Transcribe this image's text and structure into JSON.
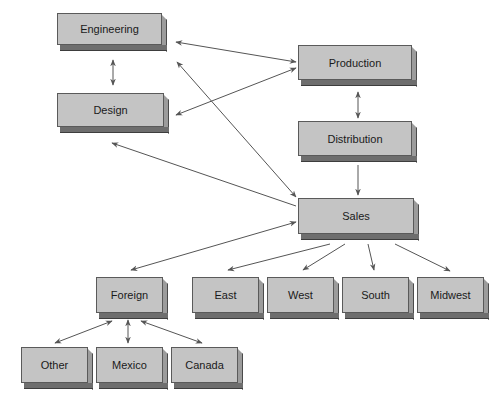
{
  "diagram": {
    "type": "organizational-flow",
    "colors": {
      "box_face": "#c4c4c4",
      "box_side": "#9c9c9c",
      "box_bottom": "#6e6e6e",
      "arrow": "#555555"
    },
    "nodes": {
      "engineering": {
        "label": "Engineering",
        "x": 57,
        "y": 13,
        "w": 110,
        "h": 38
      },
      "production": {
        "label": "Production",
        "x": 298,
        "y": 45,
        "w": 119,
        "h": 41
      },
      "design": {
        "label": "Design",
        "x": 57,
        "y": 93,
        "w": 112,
        "h": 40
      },
      "distribution": {
        "label": "Distribution",
        "x": 298,
        "y": 121,
        "w": 119,
        "h": 41
      },
      "sales": {
        "label": "Sales",
        "x": 298,
        "y": 198,
        "w": 121,
        "h": 42
      },
      "foreign": {
        "label": "Foreign",
        "x": 96,
        "y": 277,
        "w": 72,
        "h": 42
      },
      "east": {
        "label": "East",
        "x": 192,
        "y": 277,
        "w": 72,
        "h": 42
      },
      "west": {
        "label": "West",
        "x": 267,
        "y": 277,
        "w": 72,
        "h": 42
      },
      "south": {
        "label": "South",
        "x": 342,
        "y": 277,
        "w": 72,
        "h": 42
      },
      "midwest": {
        "label": "Midwest",
        "x": 417,
        "y": 277,
        "w": 72,
        "h": 42
      },
      "other": {
        "label": "Other",
        "x": 21,
        "y": 347,
        "w": 72,
        "h": 42
      },
      "mexico": {
        "label": "Mexico",
        "x": 96,
        "y": 347,
        "w": 72,
        "h": 42
      },
      "canada": {
        "label": "Canada",
        "x": 171,
        "y": 347,
        "w": 72,
        "h": 42
      }
    },
    "edges": [
      {
        "from": "engineering",
        "to": "design",
        "bidirectional": true,
        "x1": 113,
        "y1": 60,
        "x2": 113,
        "y2": 85
      },
      {
        "from": "engineering",
        "to": "production",
        "bidirectional": true,
        "x1": 176,
        "y1": 42,
        "x2": 296,
        "y2": 62
      },
      {
        "from": "design",
        "to": "production",
        "bidirectional": true,
        "x1": 176,
        "y1": 115,
        "x2": 296,
        "y2": 68
      },
      {
        "from": "engineering",
        "to": "sales",
        "bidirectional": true,
        "x1": 177,
        "y1": 62,
        "x2": 296,
        "y2": 197
      },
      {
        "from": "sales",
        "to": "design",
        "bidirectional": false,
        "x1": 296,
        "y1": 206,
        "x2": 112,
        "y2": 143
      },
      {
        "from": "production",
        "to": "distribution",
        "bidirectional": true,
        "x1": 358,
        "y1": 92,
        "x2": 358,
        "y2": 118
      },
      {
        "from": "distribution",
        "to": "sales",
        "bidirectional": false,
        "x1": 358,
        "y1": 165,
        "x2": 358,
        "y2": 195
      },
      {
        "from": "sales",
        "to": "foreign",
        "bidirectional": true,
        "x1": 296,
        "y1": 222,
        "x2": 131,
        "y2": 270
      },
      {
        "from": "sales",
        "to": "east",
        "bidirectional": false,
        "x1": 330,
        "y1": 244,
        "x2": 228,
        "y2": 270
      },
      {
        "from": "sales",
        "to": "west",
        "bidirectional": false,
        "x1": 345,
        "y1": 244,
        "x2": 303,
        "y2": 270
      },
      {
        "from": "sales",
        "to": "south",
        "bidirectional": false,
        "x1": 368,
        "y1": 244,
        "x2": 374,
        "y2": 270
      },
      {
        "from": "sales",
        "to": "midwest",
        "bidirectional": false,
        "x1": 395,
        "y1": 244,
        "x2": 450,
        "y2": 271
      },
      {
        "from": "foreign",
        "to": "other",
        "bidirectional": true,
        "x1": 112,
        "y1": 321,
        "x2": 55,
        "y2": 343
      },
      {
        "from": "foreign",
        "to": "mexico",
        "bidirectional": true,
        "x1": 128,
        "y1": 320,
        "x2": 128,
        "y2": 343
      },
      {
        "from": "foreign",
        "to": "canada",
        "bidirectional": true,
        "x1": 141,
        "y1": 321,
        "x2": 202,
        "y2": 343
      }
    ]
  }
}
